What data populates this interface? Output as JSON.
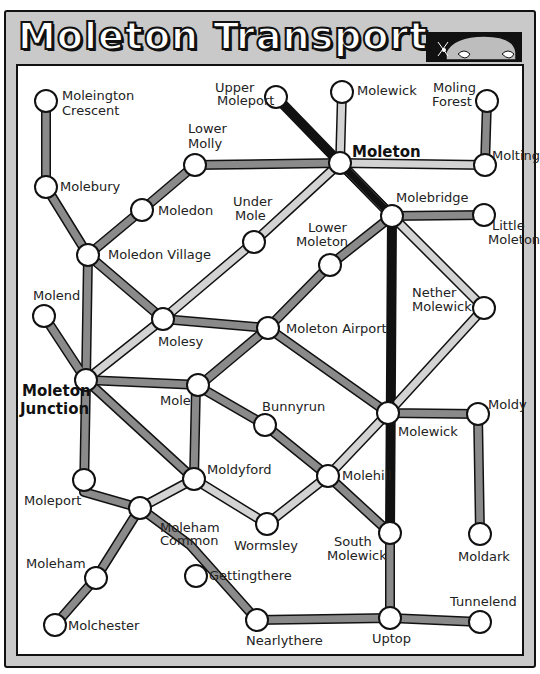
{
  "header": {
    "title": "Moleton Transport",
    "illustration": "mole-peeking-icon"
  },
  "colors": {
    "frame": "#c9c9c9",
    "line_dark": "#111111",
    "line_medium": "#8a8a8a",
    "line_light": "#cfcfcf",
    "station_fill": "#ffffff"
  },
  "stations": [
    {
      "id": "moleington_crescent",
      "label": "Moleington\nCrescent"
    },
    {
      "id": "molebury",
      "label": "Molebury"
    },
    {
      "id": "lower_molly",
      "label": "Lower\nMolly"
    },
    {
      "id": "moledon",
      "label": "Moledon"
    },
    {
      "id": "moledon_village",
      "label": "Moledon Village"
    },
    {
      "id": "upper_moleport",
      "label": "Upper\nMoleport"
    },
    {
      "id": "molewick_north",
      "label": "Molewick"
    },
    {
      "id": "moling_forest",
      "label": "Moling\nForest"
    },
    {
      "id": "moleton",
      "label": "Moleton"
    },
    {
      "id": "molting",
      "label": "Molting"
    },
    {
      "id": "under_mole",
      "label": "Under\nMole"
    },
    {
      "id": "lower_moleton",
      "label": "Lower\nMoleton"
    },
    {
      "id": "molebridge",
      "label": "Molebridge"
    },
    {
      "id": "little_moleton",
      "label": "Little\nMoleton"
    },
    {
      "id": "molend",
      "label": "Molend"
    },
    {
      "id": "molesy",
      "label": "Molesy"
    },
    {
      "id": "moleton_airport",
      "label": "Moleton Airport"
    },
    {
      "id": "nether_molewick",
      "label": "Nether\nMolewick"
    },
    {
      "id": "moleton_junction",
      "label": "Moleton\nJunction"
    },
    {
      "id": "mole",
      "label": "Mole"
    },
    {
      "id": "bunnyrun",
      "label": "Bunnyrun"
    },
    {
      "id": "molewick",
      "label": "Molewick"
    },
    {
      "id": "moldy",
      "label": "Moldy"
    },
    {
      "id": "moldyford",
      "label": "Moldyford"
    },
    {
      "id": "molehill",
      "label": "Molehill"
    },
    {
      "id": "moleport",
      "label": "Moleport"
    },
    {
      "id": "moleham_common",
      "label": "Moleham\nCommon"
    },
    {
      "id": "wormsley",
      "label": "Wormsley"
    },
    {
      "id": "south_molewick",
      "label": "South\nMolewick"
    },
    {
      "id": "moldark",
      "label": "Moldark"
    },
    {
      "id": "moleham",
      "label": "Moleham"
    },
    {
      "id": "gettingthere",
      "label": "Gettingthere"
    },
    {
      "id": "molchester",
      "label": "Molchester"
    },
    {
      "id": "nearlythere",
      "label": "Nearlythere"
    },
    {
      "id": "uptop",
      "label": "Uptop"
    },
    {
      "id": "tunnelend",
      "label": "Tunnelend"
    }
  ]
}
